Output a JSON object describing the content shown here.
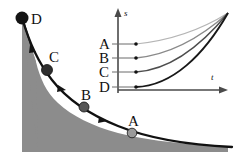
{
  "figure": {
    "name": "decay-curve-with-inset-graph",
    "background_color": "#ffffff",
    "shaded_region_color": "#8c8c8c",
    "curve_color": "#111111"
  },
  "main_plot": {
    "points": [
      {
        "label": "D",
        "x": 22,
        "y": 18,
        "radius": 6.5,
        "fill": "#141414",
        "label_x": 31,
        "label_y": 20
      },
      {
        "label": "C",
        "x": 47,
        "y": 70,
        "radius": 5.5,
        "fill": "#2f2f2f",
        "label_x": 49,
        "label_y": 60
      },
      {
        "label": "B",
        "x": 84,
        "y": 107,
        "radius": 5.0,
        "fill": "#565656",
        "label_x": 84,
        "label_y": 98
      },
      {
        "label": "A",
        "x": 132,
        "y": 133,
        "radius": 4.8,
        "fill": "#9a9a9a",
        "label_x": 130,
        "label_y": 124
      }
    ],
    "arrow_markers": [
      {
        "x": 31,
        "y": 48,
        "angle": 62
      },
      {
        "x": 62,
        "y": 88,
        "angle": 42
      },
      {
        "x": 103,
        "y": 119,
        "angle": 25
      }
    ]
  },
  "inset": {
    "y_axis_label": "s",
    "x_axis_label": "t",
    "curve_labels": [
      "A",
      "B",
      "C",
      "D"
    ],
    "curves": [
      {
        "label": "A",
        "start_y": 44,
        "stroke": "#b5b5b5",
        "width": 1.1
      },
      {
        "label": "B",
        "start_y": 58,
        "stroke": "#8a8a8a",
        "width": 1.3
      },
      {
        "label": "C",
        "start_y": 72,
        "stroke": "#4d4d4d",
        "width": 1.5
      },
      {
        "label": "D",
        "start_y": 87,
        "stroke": "#181818",
        "width": 1.9
      }
    ],
    "axis_color": "#4a4a4a",
    "converge_x": 228,
    "converge_y": 13
  }
}
